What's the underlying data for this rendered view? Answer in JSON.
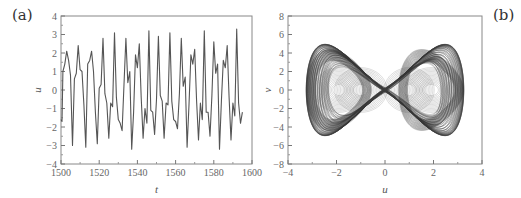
{
  "chart_data": [
    {
      "panel": "(a)",
      "type": "line",
      "title": "",
      "xlabel": "t",
      "ylabel": "u",
      "xlim": [
        1500,
        1600
      ],
      "ylim": [
        -4,
        4
      ],
      "xticks": [
        1500,
        1520,
        1540,
        1560,
        1580,
        1600
      ],
      "yticks": [
        -4,
        -3,
        -2,
        -1,
        0,
        1,
        2,
        3,
        4
      ],
      "grid": false,
      "series": [
        {
          "name": "u(t)",
          "color": "#555555",
          "x": [
            1500,
            1500.5,
            1501,
            1502,
            1503,
            1504,
            1505,
            1506,
            1507,
            1508,
            1509,
            1510,
            1511,
            1512,
            1513,
            1514,
            1515,
            1516,
            1517,
            1518,
            1519,
            1520,
            1521,
            1522,
            1523,
            1524,
            1525,
            1526,
            1527,
            1528,
            1529,
            1530,
            1531,
            1532,
            1533,
            1534,
            1535,
            1536,
            1537,
            1538,
            1539,
            1540,
            1541,
            1542,
            1543,
            1544,
            1545,
            1546,
            1547,
            1548,
            1549,
            1550,
            1551,
            1552,
            1553,
            1554,
            1555,
            1556,
            1557,
            1558,
            1559,
            1560,
            1561,
            1562,
            1563,
            1564,
            1565,
            1566,
            1567,
            1568,
            1569,
            1570,
            1571,
            1572,
            1573,
            1574,
            1575,
            1576,
            1577,
            1578,
            1579,
            1580,
            1581,
            1582,
            1583,
            1584,
            1585,
            1586,
            1587,
            1588,
            1589,
            1590,
            1591,
            1592,
            1593,
            1594,
            1595,
            1596,
            1597,
            1598,
            1599,
            1600
          ],
          "values": [
            -1.6,
            -1.7,
            1.0,
            1.4,
            2.1,
            1.6,
            0.8,
            -3.0,
            0.6,
            0.9,
            2.4,
            1.1,
            1.0,
            -0.8,
            -3.1,
            1.4,
            1.6,
            2.1,
            1.0,
            -1.2,
            -2.9,
            0.1,
            0.3,
            2.8,
            -0.2,
            -0.7,
            -2.6,
            -0.7,
            -0.9,
            3.1,
            -0.4,
            -1.6,
            -1.8,
            -2.2,
            0.3,
            2.8,
            0.4,
            1.0,
            -3.2,
            -1.2,
            1.9,
            1.2,
            2.5,
            -0.4,
            -2.6,
            -1.0,
            -1.8,
            3.2,
            -1.1,
            -1.2,
            -2.4,
            -0.5,
            2.9,
            -0.3,
            -0.6,
            -2.6,
            -0.7,
            -0.8,
            3.1,
            -0.6,
            -1.6,
            -1.7,
            -2.1,
            -0.2,
            2.8,
            0.2,
            0.7,
            -3.1,
            -0.8,
            1.9,
            1.4,
            2.2,
            -0.6,
            -2.7,
            -0.7,
            -1.6,
            3.2,
            -1.2,
            -1.2,
            -2.5,
            -0.3,
            2.6,
            0.9,
            1.4,
            -3.2,
            -0.6,
            1.6,
            1.2,
            2.4,
            -0.4,
            -2.7,
            -0.7,
            -1.4,
            3.3,
            -0.7,
            -1.8,
            -1.2
          ]
        }
      ]
    },
    {
      "panel": "(b)",
      "type": "line",
      "title": "",
      "xlabel": "u",
      "ylabel": "v",
      "xlim": [
        -4,
        4
      ],
      "ylim": [
        -8,
        8
      ],
      "xticks": [
        -4,
        -2,
        0,
        2,
        4
      ],
      "yticks": [
        -8,
        -6,
        -4,
        -2,
        0,
        2,
        4,
        6,
        8
      ],
      "grid": false,
      "description": "Phase portrait: double-scroll chaotic attractor spanning u in [-3.3, 3.3], v in [-6, 6], with inner loops centered near u = ±2 and u = ±1",
      "series": [
        {
          "name": "trajectory",
          "color": "#333333"
        }
      ]
    }
  ],
  "labels": {
    "panel_a": "(a)",
    "panel_b": "(b)"
  }
}
